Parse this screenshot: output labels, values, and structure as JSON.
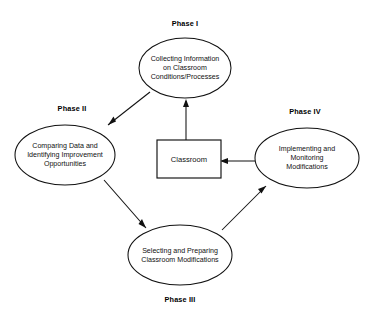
{
  "diagram": {
    "background_color": "#ffffff",
    "stroke_color": "#111111",
    "center_box": {
      "label": "Classroom"
    },
    "nodes": [
      {
        "id": "phase-1",
        "phase_label": "Phase I",
        "lines": [
          "Collecting Information",
          "on Classroom",
          "Conditions/Processes"
        ]
      },
      {
        "id": "phase-2",
        "phase_label": "Phase II",
        "lines": [
          "Comparing Data and",
          "Identifying Improvement",
          "Opportunities"
        ]
      },
      {
        "id": "phase-3",
        "phase_label": "Phase III",
        "lines": [
          "Selecting and Preparing",
          "Classroom Modifications"
        ]
      },
      {
        "id": "phase-4",
        "phase_label": "Phase IV",
        "lines": [
          "Implementing and",
          "Monitoring",
          "Modifications"
        ]
      }
    ]
  }
}
